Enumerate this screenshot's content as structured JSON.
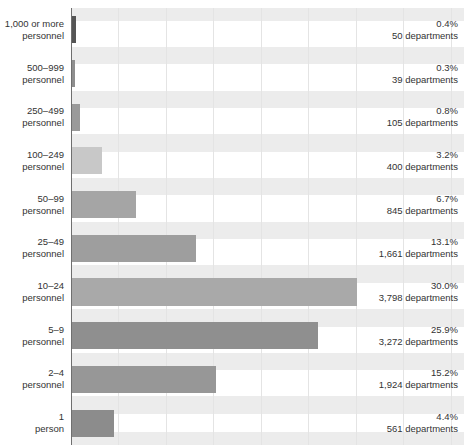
{
  "chart_data": {
    "type": "bar",
    "orientation": "horizontal",
    "title": "",
    "subtitle": "",
    "xlabel": "",
    "ylabel": "",
    "xlim": [
      0,
      41.4
    ],
    "grid": true,
    "grid_axis": "x",
    "gridline_step_percent": 5,
    "legend": "none",
    "value_unit": "percent",
    "categories": [
      "1,000 or more personnel",
      "500–999 personnel",
      "250–499 personnel",
      "100–249 personnel",
      "50–99 personnel",
      "25–49 personnel",
      "10–24 personnel",
      "5–9 personnel",
      "2–4 personnel",
      "1 person"
    ],
    "values": [
      0.4,
      0.3,
      0.8,
      3.2,
      6.7,
      13.1,
      30.0,
      25.9,
      15.2,
      4.4
    ],
    "counts": [
      50,
      39,
      105,
      400,
      845,
      1661,
      3798,
      3272,
      1924,
      561
    ],
    "rows": [
      {
        "label_line1": "1,000 or more",
        "label_line2": "personnel",
        "percent": 0.4,
        "percent_text": "0.4%",
        "count": 50,
        "count_text": "50 departments",
        "bar_color": "#555555"
      },
      {
        "label_line1": "500–999",
        "label_line2": "personnel",
        "percent": 0.3,
        "percent_text": "0.3%",
        "count": 39,
        "count_text": "39 departments",
        "bar_color": "#8e8e8e"
      },
      {
        "label_line1": "250–499",
        "label_line2": "personnel",
        "percent": 0.8,
        "percent_text": "0.8%",
        "count": 105,
        "count_text": "105 departments",
        "bar_color": "#9a9a9a"
      },
      {
        "label_line1": "100–249",
        "label_line2": "personnel",
        "percent": 3.2,
        "percent_text": "3.2%",
        "count": 400,
        "count_text": "400 departments",
        "bar_color": "#c8c8c8"
      },
      {
        "label_line1": "50–99",
        "label_line2": "personnel",
        "percent": 6.7,
        "percent_text": "6.7%",
        "count": 845,
        "count_text": "845 departments",
        "bar_color": "#a5a5a5"
      },
      {
        "label_line1": "25–49",
        "label_line2": "personnel",
        "percent": 13.1,
        "percent_text": "13.1%",
        "count": 1661,
        "count_text": "1,661 departments",
        "bar_color": "#9e9e9e"
      },
      {
        "label_line1": "10–24",
        "label_line2": "personnel",
        "percent": 30.0,
        "percent_text": "30.0%",
        "count": 3798,
        "count_text": "3,798 departments",
        "bar_color": "#a9a9a9"
      },
      {
        "label_line1": "5–9",
        "label_line2": "personnel",
        "percent": 25.9,
        "percent_text": "25.9%",
        "count": 3272,
        "count_text": "3,272 departments",
        "bar_color": "#8f8f8f"
      },
      {
        "label_line1": "2–4",
        "label_line2": "personnel",
        "percent": 15.2,
        "percent_text": "15.2%",
        "count": 1924,
        "count_text": "1,924 departments",
        "bar_color": "#979797"
      },
      {
        "label_line1": "1",
        "label_line2": "person",
        "percent": 4.4,
        "percent_text": "4.4%",
        "count": 561,
        "count_text": "561 departments",
        "bar_color": "#8c8c8c"
      }
    ],
    "colors": {
      "band": "#ececec",
      "gridline": "#e4e4e4",
      "axis": "#6f6f6f",
      "text": "#333333",
      "background": "#ffffff"
    }
  }
}
